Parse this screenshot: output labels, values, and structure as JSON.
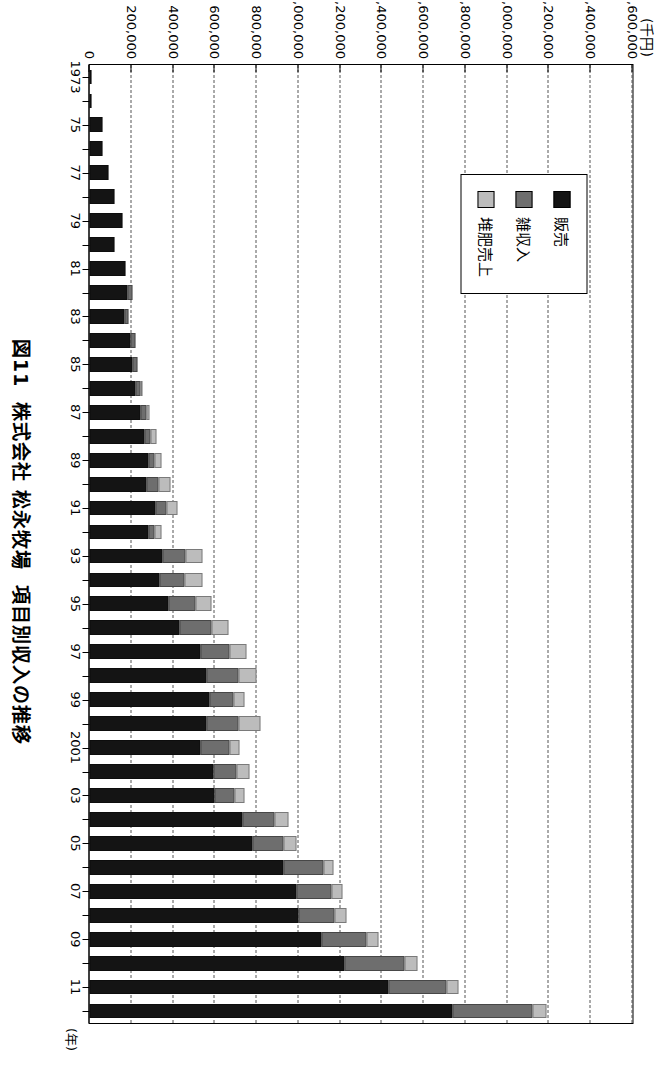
{
  "figure": {
    "caption": "図11  株式会社 松永牧場  項目別収入の推移",
    "unit_label": "(千円)",
    "category_axis_suffix": "(年)"
  },
  "legend": {
    "position": "inside-upper-left",
    "items": [
      {
        "label": "販売",
        "color": "#141414"
      },
      {
        "label": "雑収入",
        "color": "#6e6e6e"
      },
      {
        "label": "堆肥売上",
        "color": "#bcbcbc"
      }
    ]
  },
  "chart_data": {
    "type": "bar",
    "orientation": "horizontal-stacked",
    "stacked": true,
    "title": "図11  株式会社 松永牧場  項目別収入の推移",
    "xlabel": "(年)",
    "ylabel": "(千円)",
    "ylim": [
      0,
      2600000
    ],
    "ytick_step": 200000,
    "grid": true,
    "ytick_labels": [
      "0",
      "200,000",
      "400,000",
      "600,000",
      "800,000",
      "1,000,000",
      "1,200,000",
      "1,400,000",
      "1,600,000",
      "1,800,000",
      "2,000,000",
      "2,200,000",
      "2,400,000",
      "2,600,000"
    ],
    "ytick_values": [
      0,
      200000,
      400000,
      600000,
      800000,
      1000000,
      1200000,
      1400000,
      1600000,
      1800000,
      2000000,
      2200000,
      2400000,
      2600000
    ],
    "categories": [
      "1973",
      "74",
      "75",
      "76",
      "77",
      "78",
      "79",
      "80",
      "81",
      "82",
      "83",
      "84",
      "85",
      "86",
      "87",
      "88",
      "89",
      "90",
      "91",
      "92",
      "93",
      "94",
      "95",
      "96",
      "97",
      "98",
      "99",
      "2000",
      "2001",
      "02",
      "03",
      "04",
      "05",
      "06",
      "07",
      "08",
      "09",
      "10",
      "11",
      "12"
    ],
    "category_tick_labels": [
      "1973",
      "",
      "75",
      "",
      "77",
      "",
      "79",
      "",
      "81",
      "",
      "83",
      "",
      "85",
      "",
      "87",
      "",
      "89",
      "",
      "91",
      "",
      "93",
      "",
      "95",
      "",
      "97",
      "",
      "99",
      "",
      "2001",
      "",
      "03",
      "",
      "05",
      "",
      "07",
      "",
      "09",
      "",
      "11",
      ""
    ],
    "series": [
      {
        "name": "販売",
        "color": "#141414",
        "values": [
          8000,
          10000,
          60000,
          62000,
          90000,
          118000,
          158000,
          120000,
          172000,
          182000,
          168000,
          197000,
          205000,
          218000,
          243000,
          262000,
          281000,
          275000,
          316000,
          282000,
          352000,
          337000,
          378000,
          430000,
          530000,
          560000,
          573000,
          560000,
          530000,
          595000,
          600000,
          733000,
          780000,
          930000,
          990000,
          1000000,
          1110000,
          1220000,
          1430000,
          1740000
        ]
      },
      {
        "name": "雑収入",
        "color": "#6e6e6e",
        "values": [
          0,
          0,
          0,
          0,
          0,
          0,
          0,
          0,
          0,
          22000,
          18000,
          23000,
          25000,
          25000,
          28000,
          28000,
          32000,
          55000,
          53000,
          30000,
          110000,
          120000,
          128000,
          155000,
          140000,
          155000,
          115000,
          155000,
          140000,
          110000,
          95000,
          155000,
          150000,
          190000,
          170000,
          175000,
          215000,
          290000,
          280000,
          380000
        ]
      },
      {
        "name": "堆肥売上",
        "color": "#bcbcbc",
        "values": [
          0,
          0,
          0,
          0,
          0,
          0,
          0,
          0,
          0,
          0,
          0,
          0,
          0,
          10000,
          14000,
          30000,
          30000,
          60000,
          53000,
          32000,
          80000,
          82000,
          80000,
          80000,
          83000,
          83000,
          55000,
          105000,
          50000,
          60000,
          45000,
          65000,
          60000,
          50000,
          52000,
          58000,
          60000,
          60000,
          55000,
          70000
        ]
      }
    ]
  }
}
